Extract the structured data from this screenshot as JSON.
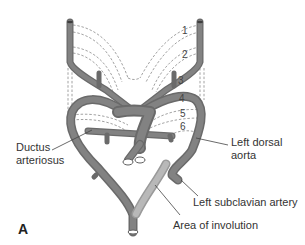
{
  "figure": {
    "panel_label": "A",
    "arch_numbers": [
      "1",
      "2",
      "3",
      "4",
      "5",
      "6"
    ],
    "labels": {
      "ductus_line1": "Ductus",
      "ductus_line2": "arteriosus",
      "left_dorsal_line1": "Left dorsal",
      "left_dorsal_line2": "aorta",
      "left_subclavian": "Left subclavian artery",
      "area_involution": "Area of involution"
    },
    "colors": {
      "vessel": "#7a7a7a",
      "vessel_dark": "#5e5e5e",
      "involution": "#b4b4b4",
      "dashed": "#8a8a8a",
      "text": "#333333"
    }
  }
}
